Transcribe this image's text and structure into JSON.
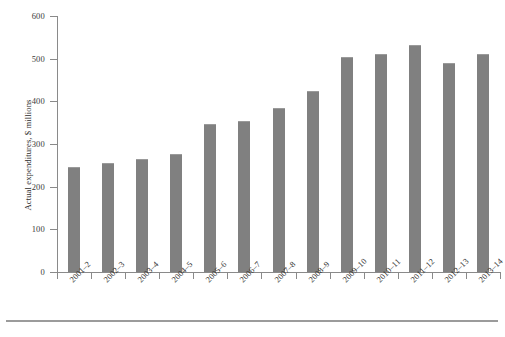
{
  "chart_data": {
    "type": "bar",
    "title": "",
    "xlabel": "",
    "ylabel": "Actual expenditures, $ millions",
    "ylim": [
      0,
      600
    ],
    "yticks": [
      0,
      100,
      200,
      300,
      400,
      500,
      600
    ],
    "ytick_labels": [
      "0",
      "100",
      "200",
      "300",
      "400",
      "500",
      "600"
    ],
    "grid": false,
    "legend": "none",
    "bar_color": "#808080",
    "axis_color": "#8a8a8a",
    "categories": [
      "2001–2",
      "2002–3",
      "2003–4",
      "2004–5",
      "2005–6",
      "2006–7",
      "2007–8",
      "2008–9",
      "2009–10",
      "2010–11",
      "2011–12",
      "2012–13",
      "2013–14"
    ],
    "values": [
      245,
      255,
      266,
      276,
      346,
      353,
      385,
      425,
      505,
      510,
      533,
      490,
      510
    ],
    "series": [
      {
        "name": "Actual expenditures",
        "values": [
          245,
          255,
          266,
          276,
          346,
          353,
          385,
          425,
          505,
          510,
          533,
          490,
          510
        ]
      }
    ]
  },
  "figure": {
    "caption": ""
  }
}
